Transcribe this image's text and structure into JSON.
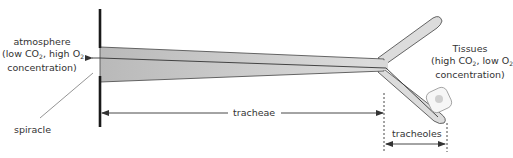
{
  "labels": {
    "atmosphere": {
      "line1": "atmosphere",
      "line2_prefix": "(low CO",
      "line2_sub1": "2",
      "line2_mid": ", high O",
      "line2_sub2": "2",
      "line3": "concentration)"
    },
    "tissues": {
      "line1": "Tissues",
      "line2_prefix": "(high CO",
      "line2_sub1": "2",
      "line2_mid": ", low O",
      "line2_sub2": "2",
      "line3": "concentration)"
    },
    "spiracle": "spiracle",
    "tracheae": "tracheae",
    "tracheoles": "tracheoles"
  },
  "colors": {
    "tube_fill": "#c4c4c4",
    "tube_stroke": "#555555",
    "wall": "#1a1a1a",
    "cell_fill": "#f4f4f4",
    "cell_nucleus": "#cfcfcf",
    "text": "#333333"
  }
}
